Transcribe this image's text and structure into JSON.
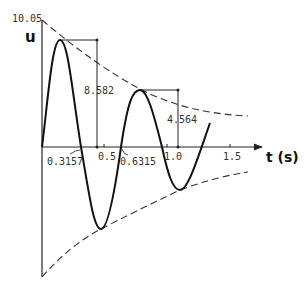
{
  "diagram": {
    "y_axis": {
      "label": "u",
      "max_label": "10.05"
    },
    "x_axis": {
      "label": "t (s)",
      "ticks": [
        "0.5",
        "1.0",
        "1.5"
      ]
    },
    "annotations": {
      "first_peak_amplitude": "8.582",
      "second_peak_amplitude": "4.564",
      "first_zero_crossing": "0.3157",
      "second_zero_crossing": "0.6315"
    },
    "colors": {
      "curve": "#111111",
      "envelope": "#333333",
      "axis": "#222222"
    }
  }
}
